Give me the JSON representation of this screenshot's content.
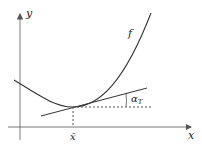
{
  "diagram": {
    "axis_labels": {
      "y": "y",
      "x": "x"
    },
    "curve_label": "f",
    "point_label": "x̄",
    "angle_label": {
      "main": "α",
      "sub": "T"
    },
    "colors": {
      "axes": "#777777",
      "curve": "#333333",
      "tangent": "#333333",
      "dashed": "#555555"
    }
  }
}
